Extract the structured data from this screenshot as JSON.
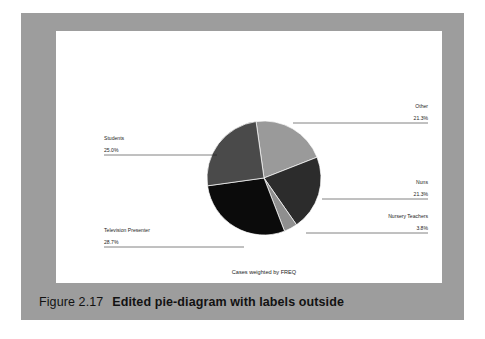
{
  "figure": {
    "number": "Figure 2.17",
    "title": "Edited pie-diagram with labels outside"
  },
  "chart_footnote": "Cases weighted by FREQ",
  "colors": {
    "page_background": "#ffffff",
    "figure_background": "#9d9d9d",
    "caption_text": "#121212",
    "label_text": "#1c1c1c",
    "leader_line": "#1c1c1c"
  },
  "labels": {
    "other_name": "Other",
    "other_pct": "21.3%",
    "nuns_name": "Nuns",
    "nuns_pct": "21.3%",
    "nursery_name": "Nursery Teachers",
    "nursery_pct": "3.8%",
    "tv_name": "Television Presenter",
    "tv_pct": "28.7%",
    "students_name": "Students",
    "students_pct": "25.0%"
  },
  "chart_data": {
    "type": "pie",
    "title": "",
    "subtitle": "",
    "annotations": [
      "Cases weighted by FREQ"
    ],
    "legend_position": "outside-labels",
    "labels_outside": true,
    "start_angle_deg": -8,
    "direction": "clockwise",
    "categories": [
      "Other",
      "Nuns",
      "Nursery Teachers",
      "Television Presenter",
      "Students"
    ],
    "values": [
      21.3,
      21.3,
      3.8,
      28.7,
      25.0
    ],
    "value_labels": [
      "21.3%",
      "21.3%",
      "3.8%",
      "28.7%",
      "25.0%"
    ],
    "units": "percent",
    "total": 100.1,
    "slice_colors": [
      "#9a9a9a",
      "#2c2c2c",
      "#8f8f8f",
      "#0b0b0b",
      "#4a4a4a"
    ],
    "series": [
      {
        "name": "Percent of cases",
        "values": [
          21.3,
          21.3,
          3.8,
          28.7,
          25.0
        ]
      }
    ]
  }
}
